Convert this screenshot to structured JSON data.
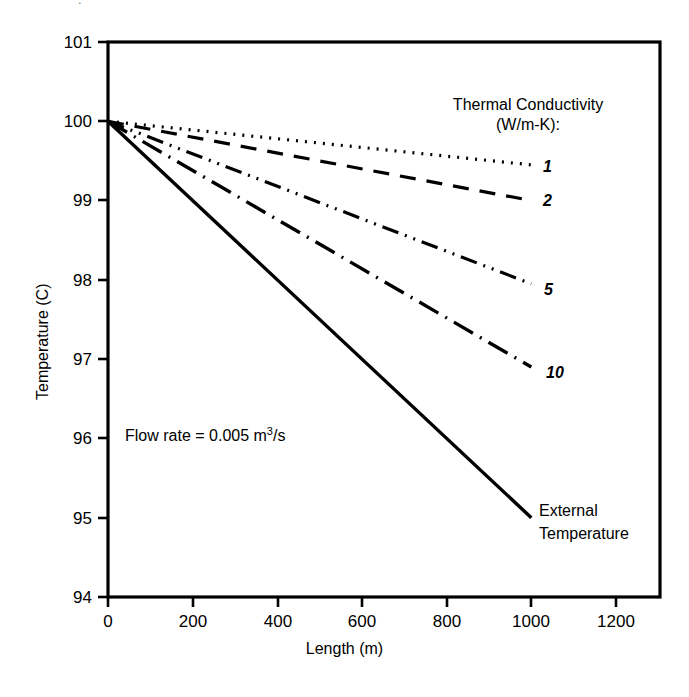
{
  "top_fragment": ".",
  "chart_data": {
    "type": "line",
    "title": "",
    "xlabel": "Length (m)",
    "ylabel": "Temperature (C)",
    "xlim": [
      0,
      1304
    ],
    "ylim": [
      94,
      101
    ],
    "xticks": [
      0,
      200,
      400,
      600,
      800,
      1000,
      1200
    ],
    "yticks": [
      94,
      95,
      96,
      97,
      98,
      99,
      100,
      101
    ],
    "grid": false,
    "legend_position": "inline-right",
    "legend_title_line1": "Thermal Conductivity",
    "legend_title_line2": "(W/m-K):",
    "annotation": "Flow rate = 0.005 m",
    "annotation_sup": "3",
    "annotation_tail": "/s",
    "external_label_line1": "External",
    "external_label_line2": "Temperature",
    "x": [
      0,
      1000
    ],
    "series": [
      {
        "name": "1",
        "label": "1",
        "values": [
          100,
          99.45
        ],
        "style": "dotted",
        "dash": "2,7",
        "width": 3.2
      },
      {
        "name": "2",
        "label": "2",
        "values": [
          100,
          99.0
        ],
        "style": "dashed",
        "dash": "16,11",
        "width": 3.2
      },
      {
        "name": "5",
        "label": "5",
        "values": [
          100,
          97.95
        ],
        "style": "dash-dot-dot",
        "dash": "17,7,2,7,2,7",
        "width": 3.2
      },
      {
        "name": "10",
        "label": "10",
        "values": [
          100,
          96.9
        ],
        "style": "dash-dot",
        "dash": "22,8,2,8",
        "width": 3.4
      },
      {
        "name": "External Temperature",
        "label": "",
        "values": [
          100,
          95.0
        ],
        "style": "solid",
        "dash": "",
        "width": 3.4
      }
    ]
  }
}
